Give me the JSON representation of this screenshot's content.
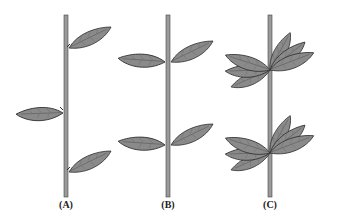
{
  "figure": {
    "panels": [
      {
        "id": "A",
        "label": "(A)",
        "arrangement": "alternate",
        "stem_x": 66,
        "nodes": [
          {
            "y": 50,
            "leaves": [
              "right"
            ]
          },
          {
            "y": 113,
            "leaves": [
              "left"
            ]
          },
          {
            "y": 172,
            "leaves": [
              "right"
            ]
          }
        ]
      },
      {
        "id": "B",
        "label": "(B)",
        "arrangement": "opposite",
        "stem_x": 168,
        "nodes": [
          {
            "y": 62,
            "leaves": [
              "left",
              "right"
            ]
          },
          {
            "y": 145,
            "leaves": [
              "left",
              "right"
            ]
          }
        ]
      },
      {
        "id": "C",
        "label": "(C)",
        "arrangement": "whorled",
        "stem_x": 270,
        "nodes": [
          {
            "y": 70,
            "leaves": [
              "whorl"
            ]
          },
          {
            "y": 153,
            "leaves": [
              "whorl"
            ]
          }
        ]
      }
    ],
    "colors": {
      "leaf_fill": "#8a8a8a",
      "leaf_stroke": "#333333",
      "stem_fill": "#9a9a9a",
      "stem_stroke": "#444444"
    }
  }
}
